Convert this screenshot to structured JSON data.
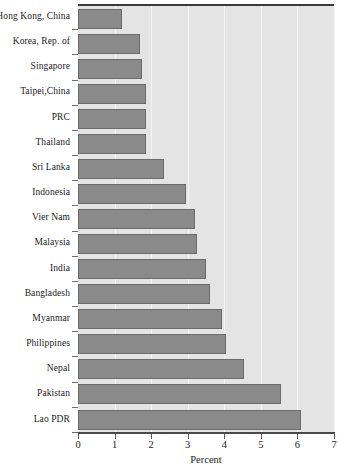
{
  "chart_data": {
    "type": "bar",
    "orientation": "horizontal",
    "title": "",
    "xlabel": "Percent",
    "ylabel": "",
    "xlim": [
      0,
      7
    ],
    "xticks": [
      "0",
      "1",
      "2",
      "3",
      "4",
      "5",
      "6",
      "7"
    ],
    "grid": true,
    "legend": false,
    "categories": [
      "Hong Kong, China",
      "Korea, Rep. of",
      "Singapore",
      "Taipei,China",
      "PRC",
      "Thailand",
      "Sri Lanka",
      "Indonesia",
      "Vier Nam",
      "Malaysia",
      "India",
      "Bangladesh",
      "Myanmar",
      "Philippines",
      "Nepal",
      "Pakistan",
      "Lao PDR"
    ],
    "values": [
      1.2,
      1.7,
      1.75,
      1.85,
      1.85,
      1.85,
      2.35,
      2.95,
      3.2,
      3.25,
      3.5,
      3.6,
      3.95,
      4.05,
      4.55,
      5.55,
      6.1
    ],
    "colors": {
      "bar_fill": "#8a8a8a",
      "bar_border": "#6b6b6b",
      "plot_background": "#e4e4e4",
      "gridline": "#f4f4f4",
      "axis": "#4a4a4a",
      "text": "#1c1c1c"
    }
  }
}
